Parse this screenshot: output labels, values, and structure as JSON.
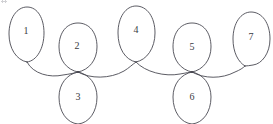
{
  "diagram": {
    "type": "loop-chain-graph",
    "canvas": {
      "width": 273,
      "height": 124,
      "background": "#ffffff"
    },
    "stroke_color": "#4a4a52",
    "label_color": "#3a3a42",
    "stroke_width": 0.9,
    "loops": [
      {
        "id": "loop-1",
        "label": "1",
        "label_x": 26,
        "label_y": 32,
        "cx": 26,
        "cy": 34,
        "rx": 17,
        "ry": 27,
        "tip_x": 27,
        "tip_y": 62,
        "orientation": "up",
        "clipped": false
      },
      {
        "id": "loop-2",
        "label": "2",
        "label_x": 77,
        "label_y": 47,
        "cx": 78,
        "cy": 48,
        "rx": 19,
        "ry": 25,
        "tip_x": 78,
        "tip_y": 72,
        "orientation": "up",
        "clipped": false
      },
      {
        "id": "loop-3",
        "label": "3",
        "label_x": 78,
        "label_y": 98,
        "cx": 78,
        "cy": 97,
        "rx": 19,
        "ry": 26,
        "tip_x": 78,
        "tip_y": 72,
        "orientation": "down",
        "clipped": true
      },
      {
        "id": "loop-4",
        "label": "4",
        "label_x": 136,
        "label_y": 31,
        "cx": 136,
        "cy": 33,
        "rx": 19,
        "ry": 28,
        "tip_x": 136,
        "tip_y": 62,
        "orientation": "up",
        "clipped": false
      },
      {
        "id": "loop-5",
        "label": "5",
        "label_x": 192,
        "label_y": 48,
        "cx": 192,
        "cy": 48,
        "rx": 19,
        "ry": 25,
        "tip_x": 192,
        "tip_y": 72,
        "orientation": "up",
        "clipped": false
      },
      {
        "id": "loop-6",
        "label": "6",
        "label_x": 192,
        "label_y": 98,
        "cx": 192,
        "cy": 97,
        "rx": 19,
        "ry": 26,
        "tip_x": 192,
        "tip_y": 72,
        "orientation": "down",
        "clipped": true
      },
      {
        "id": "loop-7",
        "label": "7",
        "label_x": 251,
        "label_y": 38,
        "cx": 251,
        "cy": 38,
        "rx": 19,
        "ry": 27,
        "tip_x": 245,
        "tip_y": 66,
        "orientation": "up",
        "clipped": false
      }
    ],
    "nodes": [
      {
        "id": "node-a",
        "x": 78,
        "y": 72,
        "joins": [
          "loop-2",
          "loop-3",
          "link-1-2",
          "link-2-4"
        ]
      },
      {
        "id": "node-b",
        "x": 192,
        "y": 72,
        "joins": [
          "loop-5",
          "loop-6",
          "link-4-5",
          "link-5-7"
        ]
      }
    ],
    "links": [
      {
        "id": "link-1-2",
        "from": "loop-1",
        "to": "node-a",
        "sag": 10
      },
      {
        "id": "link-2-4",
        "from": "node-a",
        "to": "loop-4",
        "sag": 7
      },
      {
        "id": "link-4-5",
        "from": "loop-4",
        "to": "node-b",
        "sag": 8
      },
      {
        "id": "link-5-7",
        "from": "node-b",
        "to": "loop-7",
        "sag": 8
      }
    ],
    "artifact": {
      "name": "scan-speck",
      "visible": true
    }
  }
}
